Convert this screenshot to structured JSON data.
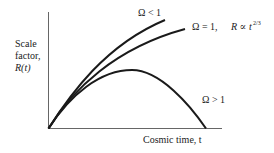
{
  "diagram": {
    "y_axis_label_lines": [
      "Scale",
      "factor,",
      "R(t)"
    ],
    "x_axis_label": "Cosmic time, t",
    "curves": [
      {
        "id": "open",
        "label": "Ω < 1"
      },
      {
        "id": "flat",
        "label": "Ω = 1,",
        "extra": "R ∝ t",
        "extra_exp": "2/3"
      },
      {
        "id": "closed",
        "label": "Ω > 1"
      }
    ]
  }
}
